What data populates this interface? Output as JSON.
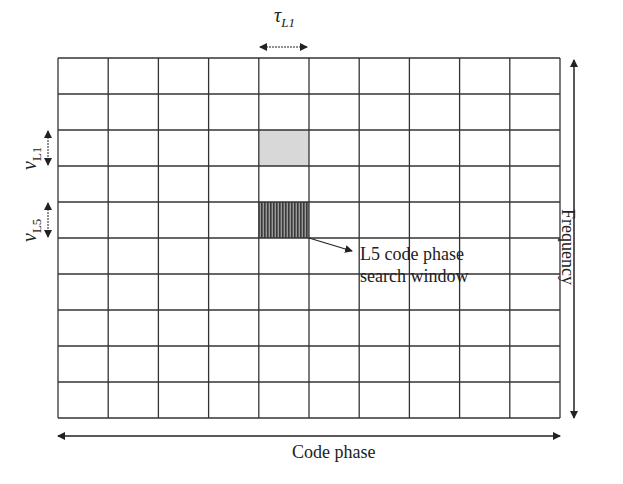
{
  "diagram": {
    "grid": {
      "rows": 10,
      "cols": 10,
      "left": 58,
      "top": 58,
      "right": 560,
      "bottom": 418,
      "line_color": "#333333"
    },
    "highlighted_cells": [
      {
        "name": "l1-cell",
        "row": 2,
        "col": 4,
        "fill": "#d8d8d8",
        "pattern": "solid"
      },
      {
        "name": "l5-code-phase-search-window-cell",
        "row": 4,
        "col": 4,
        "fill": "#5a5a5a",
        "pattern": "vertical-hatch"
      }
    ],
    "labels": {
      "tau_symbol": "τ",
      "tau_sub": "L1",
      "nu_l1_symbol": "v",
      "nu_l1_sub": "L1",
      "nu_l5_symbol": "v",
      "nu_l5_sub": "L5",
      "annotation_line1": "L5 code phase",
      "annotation_line2": "search window",
      "y_axis": "Frequency",
      "x_axis": "Code phase"
    }
  }
}
